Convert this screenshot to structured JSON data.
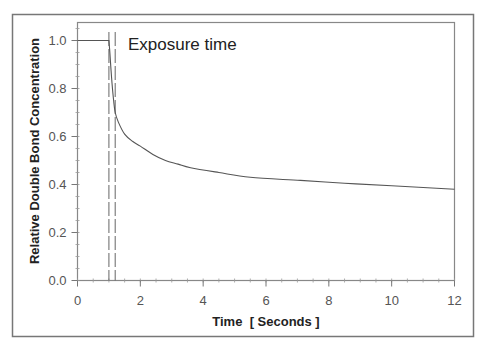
{
  "chart_data": {
    "type": "line",
    "title": "",
    "xlabel": "Time  [ Seconds ]",
    "ylabel": "Relative Double Bond Concentration",
    "xlim": [
      0,
      12
    ],
    "ylim": [
      0,
      1.07
    ],
    "x_ticks": [
      0,
      2,
      4,
      6,
      8,
      10,
      12
    ],
    "x_tick_labels": [
      "0",
      "2",
      "4",
      "6",
      "8",
      "10",
      "12"
    ],
    "x_minor_step": 0.5,
    "y_ticks": [
      0.0,
      0.2,
      0.4,
      0.6,
      0.8,
      1.0
    ],
    "y_tick_labels": [
      "0.0",
      "0.2",
      "0.4",
      "0.6",
      "0.8",
      "1.0"
    ],
    "y_minor_step": 0.05,
    "grid": false,
    "legend": null,
    "series": [
      {
        "name": "Relative Double Bond Concentration",
        "color": "#555555",
        "x": [
          0,
          1.0,
          1.03,
          1.06,
          1.1,
          1.15,
          1.2,
          1.3,
          1.5,
          1.75,
          2.0,
          2.4,
          2.8,
          3.2,
          3.6,
          4.5,
          5.5,
          7.1,
          8.5,
          10,
          12
        ],
        "y": [
          1.0,
          1.0,
          0.95,
          0.89,
          0.82,
          0.75,
          0.7,
          0.66,
          0.61,
          0.58,
          0.56,
          0.525,
          0.5,
          0.485,
          0.47,
          0.45,
          0.43,
          0.417,
          0.405,
          0.395,
          0.38
        ]
      }
    ],
    "annotations": [
      {
        "text": "Exposure time",
        "type": "vertical-dashed-lines",
        "x_values": [
          1.0,
          1.2
        ],
        "label_position": [
          1.35,
          1.0
        ]
      }
    ]
  }
}
